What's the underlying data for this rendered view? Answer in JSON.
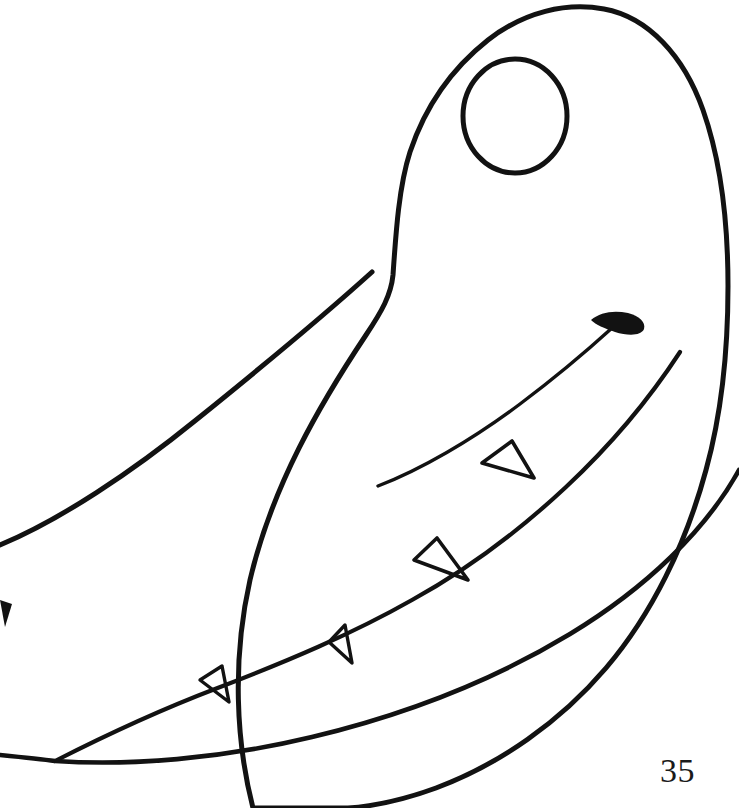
{
  "page": {
    "kind": "coloring-book-line-art",
    "background_color": "#ffffff",
    "ink_color": "#121212",
    "width": 739,
    "height": 808,
    "page_number": "35",
    "caption": ""
  },
  "artwork": {
    "title": "Crocodile head",
    "subject": "crocodile",
    "orientation": "profile facing left",
    "style": "hand-drawn black outline, uncolored",
    "parts": [
      {
        "name": "head-outline",
        "label": "Head outline"
      },
      {
        "name": "eye",
        "label": "Eye"
      },
      {
        "name": "mouth-line",
        "label": "Mouth line"
      },
      {
        "name": "nostril-mark",
        "label": "Nostril mark"
      },
      {
        "name": "upper-jaw-line",
        "label": "Upper jaw line"
      },
      {
        "name": "lower-jaw-line",
        "label": "Lower jaw line"
      },
      {
        "name": "teeth",
        "label": "Teeth"
      }
    ],
    "tooth_count": 5
  },
  "geometry": {
    "head_outline_path": "M 253 808 C 236 742 232 660 250 580 C 272 486 320 404 366 335 C 382 311 391 295 393 275 C 396 231 399 186 410 152 C 424 110 450 70 488 40 C 524 12 566 2 604 9 C 648 17 684 56 703 110 C 722 164 728 228 728 286 C 728 348 722 412 706 470 C 686 544 652 614 606 668 C 560 722 500 764 436 788 C 406 799 376 806 348 808 Z",
    "snout_ridge_path": "M 0 545 C 60 520 132 472 196 420 C 268 362 330 310 372 272",
    "eye": {
      "cx": 515,
      "cy": 116,
      "rx": 52,
      "ry": 57
    },
    "mouth_line_path": "M 378 486 C 420 470 472 440 520 404 C 560 374 590 348 612 328",
    "nostril_path": "M 591 320 C 600 312 614 310 628 313 C 639 316 646 322 644 329 C 641 336 628 336 615 332 C 604 328 596 325 591 320 Z",
    "upper_jaw_path": "M 55 761 C 110 733 160 710 215 689 C 288 661 352 634 412 600 C 470 568 520 530 566 487 C 612 444 650 398 680 352",
    "lower_jaw_path": "M 0 755 C 20 757 40 759 55 761 C 130 766 220 759 312 737 C 404 715 494 680 570 634 C 646 588 706 530 739 470",
    "left_edge_tooth_path": "M 0 600 L 12 604 L 5 627 Z",
    "teeth": [
      {
        "id": "tooth-1",
        "apex": [
          512,
          441
        ],
        "left": [
          482,
          463
        ],
        "right": [
          534,
          478
        ]
      },
      {
        "id": "tooth-2",
        "apex": [
          437,
          538
        ],
        "left": [
          414,
          560
        ],
        "right": [
          468,
          580
        ]
      },
      {
        "id": "tooth-3",
        "apex": [
          345,
          625
        ],
        "left": [
          329,
          642
        ],
        "right": [
          352,
          663
        ]
      },
      {
        "id": "tooth-4",
        "apex": [
          222,
          666
        ],
        "left": [
          200,
          680
        ],
        "right": [
          229,
          702
        ]
      }
    ]
  }
}
